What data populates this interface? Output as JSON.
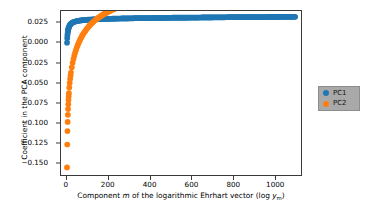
{
  "chart_data": {
    "type": "scatter",
    "title": "",
    "xlabel": "Component m of the logarithmic Ehrhart vector (log y_m)",
    "xlabel_parts": {
      "prefix": "Component ",
      "ital_m": "m",
      "mid": " of the logarithmic Ehrhart vector (log ",
      "ital_y": "y",
      "sub_m": "m",
      "suffix": ")"
    },
    "ylabel": "Coefficient in the PCA component",
    "xlim": [
      -28,
      1128
    ],
    "ylim": [
      -0.1665,
      0.0405
    ],
    "xticks": [
      0,
      200,
      400,
      600,
      800,
      1000
    ],
    "xticklabels": [
      "0",
      "200",
      "400",
      "600",
      "800",
      "1000"
    ],
    "yticks": [
      0.025,
      0.0,
      -0.025,
      -0.05,
      -0.075,
      -0.1,
      -0.125,
      -0.15
    ],
    "yticklabels": [
      "0.025",
      "0.000",
      "−0.025",
      "−0.050",
      "−0.075",
      "−0.100",
      "−0.125",
      "−0.150"
    ],
    "grid": false,
    "legend_position": "right-outside",
    "marker": "circle",
    "marker_size": 4,
    "series": [
      {
        "name": "PC1",
        "color": "#1f77b4",
        "x": [
          1,
          2,
          3,
          4,
          5,
          6,
          7,
          8,
          9,
          10,
          12,
          14,
          16,
          18,
          20,
          24,
          28,
          32,
          36,
          40,
          48,
          56,
          64,
          72,
          80,
          96,
          112,
          128,
          144,
          160,
          180,
          200,
          225,
          250,
          275,
          300,
          330,
          360,
          390,
          420,
          450,
          480,
          510,
          540,
          570,
          600,
          640,
          680,
          720,
          760,
          800,
          840,
          880,
          920,
          960,
          1000,
          1040,
          1080,
          1100
        ],
        "y": [
          0.0005,
          0.0062,
          0.0098,
          0.0125,
          0.0145,
          0.0161,
          0.0174,
          0.0185,
          0.0194,
          0.0202,
          0.0215,
          0.0225,
          0.0233,
          0.0239,
          0.0245,
          0.0253,
          0.026,
          0.0265,
          0.0269,
          0.0272,
          0.0278,
          0.0282,
          0.0285,
          0.0288,
          0.029,
          0.0294,
          0.0297,
          0.0299,
          0.0301,
          0.0303,
          0.0305,
          0.0306,
          0.0308,
          0.031,
          0.0311,
          0.0312,
          0.0314,
          0.0315,
          0.0316,
          0.0317,
          0.0318,
          0.0319,
          0.032,
          0.0321,
          0.0321,
          0.0322,
          0.0323,
          0.0324,
          0.0325,
          0.0326,
          0.0327,
          0.0327,
          0.0328,
          0.0329,
          0.0329,
          0.033,
          0.0331,
          0.0331,
          0.0332
        ]
      },
      {
        "name": "PC2",
        "color": "#ff7f0e",
        "x": [
          1,
          2,
          3,
          4,
          5,
          6,
          7,
          8,
          9,
          10,
          12,
          14,
          16,
          18,
          20,
          24,
          28,
          32,
          36,
          40,
          48,
          56,
          64,
          72,
          80,
          96,
          112,
          128,
          144,
          160,
          180,
          200,
          225,
          250,
          275,
          300,
          330,
          360,
          390,
          420,
          450,
          480,
          510,
          540,
          570,
          600,
          640,
          680,
          720,
          760,
          800,
          840,
          880,
          920,
          960,
          1000,
          1040,
          1080,
          1100
        ],
        "y": [
          -0.157,
          -0.128,
          -0.111,
          -0.0995,
          -0.0905,
          -0.0833,
          -0.0772,
          -0.0719,
          -0.0673,
          -0.0632,
          -0.0562,
          -0.0504,
          -0.0454,
          -0.0411,
          -0.0372,
          -0.0305,
          -0.0249,
          -0.0201,
          -0.0159,
          -0.0121,
          -0.0057,
          -0.0003,
          0.0043,
          0.0084,
          0.012,
          0.018,
          0.0229,
          0.027,
          0.0305,
          0.0335,
          0.0368,
          0.0396,
          0.0427,
          0.0453,
          0.0477,
          0.0497,
          0.0519,
          0.0538,
          0.0555,
          0.0571,
          0.0585,
          0.0597,
          0.0609,
          0.062,
          0.063,
          0.064,
          0.0652,
          0.0663,
          0.0673,
          0.0683,
          0.0692,
          0.07,
          0.0708,
          0.0716,
          0.0723,
          0.073,
          0.0736,
          0.0742,
          0.0745
        ]
      }
    ]
  },
  "legend": {
    "entries": [
      {
        "label": "PC1",
        "color": "#1f77b4"
      },
      {
        "label": "PC2",
        "color": "#ff7f0e"
      }
    ]
  }
}
